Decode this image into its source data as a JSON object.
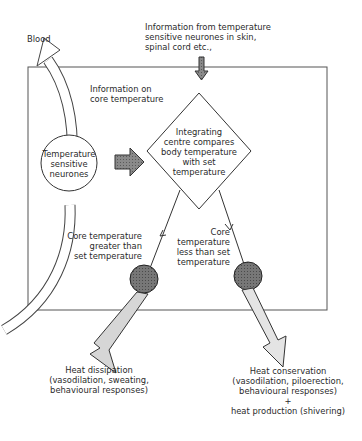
{
  "diagram": {
    "labels": {
      "blood": "Blood",
      "input_top": [
        "Information from temperature",
        "sensitive neurones in skin,",
        "spinal cord etc.,"
      ],
      "core_info": [
        "Information on",
        "core temperature"
      ],
      "neurones": [
        "Temperature",
        "sensitive",
        "neurones"
      ],
      "integrating": [
        "Integrating",
        "centre compares",
        "body temperature",
        "with set",
        "temperature"
      ],
      "greater": [
        "Core temperature",
        "greater than",
        "set temperature"
      ],
      "less": [
        "Core",
        "temperature",
        "less than set",
        "temperature"
      ],
      "dissipation": [
        "Heat dissipation",
        "(vasodilation, sweating,",
        "behavioural responses)"
      ],
      "conservation": [
        "Heat conservation",
        "(vasodilation, piloerection,",
        "behavioural responses)",
        "+",
        "heat production (shivering)"
      ]
    },
    "colors": {
      "arrow_dark": "#777777",
      "effector_circle": "#6e6e6e",
      "output_arrow": "#d4d4d4",
      "line": "#333333"
    }
  }
}
